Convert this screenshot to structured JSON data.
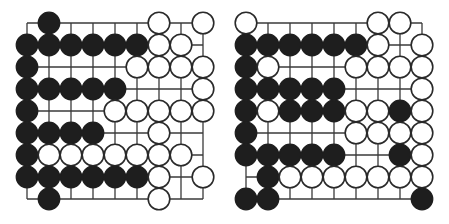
{
  "diagram": {
    "type": "go-board-diagrams",
    "colors": {
      "black": "#1e1e1e",
      "white": "#ffffff",
      "line": "#3a3a3a",
      "background": "#ffffff"
    },
    "grid": {
      "size": 9,
      "spacing": 22,
      "origin_x": 27,
      "origin_y": 23,
      "stone_radius": 10.8
    },
    "boards": [
      {
        "name": "left-board",
        "rows": [
          ".B....W.W",
          "BBBBBBWW.",
          "B....WWWW",
          "BBBBB...W",
          "B...WWWWW",
          "BBBB..W..",
          "BWWWWWWW.",
          "BBBBBBW.W",
          ".B....W.."
        ]
      },
      {
        "name": "right-board",
        "rows": [
          "W.....WW.",
          "BBBBBBW.W",
          "BW...WWWW",
          "BBBBB...W",
          "BWBBBWWBW",
          "B....WWWW",
          "BBBBB..BW",
          ".BWWWWWWW",
          "BB......B"
        ]
      }
    ]
  }
}
